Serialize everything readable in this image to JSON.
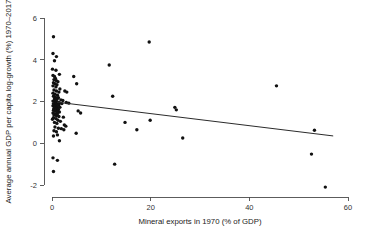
{
  "chart_data": {
    "type": "scatter",
    "title": "",
    "xlabel": "Mineral exports in 1970 (% of GDP)",
    "ylabel": "Average annual GDP per capita log-growth (%) 1970–2017",
    "xlim": [
      -2,
      62
    ],
    "ylim": [
      -2.7,
      6.4
    ],
    "xticks": [
      0,
      20,
      40,
      60
    ],
    "xtick_labels": [
      "0",
      "20",
      "40",
      "60"
    ],
    "yticks": [
      -2,
      0,
      2,
      4,
      6
    ],
    "ytick_labels": [
      "-2",
      "0",
      "2",
      "4",
      "6"
    ],
    "grid": false,
    "legend": "none",
    "marker": "filled-circle",
    "marker_color": "#111111",
    "fit_line": {
      "name": "linear fit",
      "color": "#2b2b2b",
      "x_start": 1.0,
      "y_start": 1.97,
      "x_end": 57.0,
      "y_end": 0.35
    },
    "points": [
      [
        0.3,
        5.1
      ],
      [
        0.2,
        4.3
      ],
      [
        0.9,
        4.15
      ],
      [
        0.5,
        3.95
      ],
      [
        0.1,
        3.55
      ],
      [
        0.8,
        3.5
      ],
      [
        1.5,
        3.3
      ],
      [
        0.2,
        3.25
      ],
      [
        0.5,
        3.2
      ],
      [
        0.7,
        3.1
      ],
      [
        0.4,
        3.05
      ],
      [
        0.9,
        3.0
      ],
      [
        1.2,
        2.95
      ],
      [
        0.3,
        2.9
      ],
      [
        0.6,
        2.85
      ],
      [
        1.0,
        2.8
      ],
      [
        0.2,
        2.75
      ],
      [
        0.8,
        2.7
      ],
      [
        4.4,
        3.2
      ],
      [
        5.0,
        2.85
      ],
      [
        1.6,
        2.6
      ],
      [
        0.4,
        2.55
      ],
      [
        0.9,
        2.5
      ],
      [
        1.4,
        2.45
      ],
      [
        0.2,
        2.4
      ],
      [
        0.6,
        2.35
      ],
      [
        1.1,
        2.3
      ],
      [
        2.6,
        2.5
      ],
      [
        3.0,
        2.45
      ],
      [
        0.3,
        2.25
      ],
      [
        0.7,
        2.2
      ],
      [
        1.3,
        2.18
      ],
      [
        0.5,
        2.12
      ],
      [
        1.0,
        2.1
      ],
      [
        1.8,
        2.08
      ],
      [
        2.2,
        2.05
      ],
      [
        0.2,
        2.02
      ],
      [
        0.6,
        2.0
      ],
      [
        0.9,
        1.98
      ],
      [
        1.2,
        1.96
      ],
      [
        1.5,
        1.94
      ],
      [
        0.3,
        1.9
      ],
      [
        0.7,
        1.88
      ],
      [
        1.0,
        1.86
      ],
      [
        1.4,
        1.84
      ],
      [
        2.0,
        1.9
      ],
      [
        2.9,
        1.95
      ],
      [
        3.4,
        1.92
      ],
      [
        0.2,
        1.8
      ],
      [
        0.5,
        1.78
      ],
      [
        0.8,
        1.76
      ],
      [
        1.1,
        1.74
      ],
      [
        1.6,
        1.72
      ],
      [
        0.4,
        1.68
      ],
      [
        0.9,
        1.65
      ],
      [
        1.3,
        1.62
      ],
      [
        0.3,
        1.58
      ],
      [
        0.7,
        1.55
      ],
      [
        1.0,
        1.52
      ],
      [
        1.5,
        1.5
      ],
      [
        5.3,
        1.55
      ],
      [
        5.8,
        1.45
      ],
      [
        0.2,
        1.45
      ],
      [
        0.6,
        1.42
      ],
      [
        1.1,
        1.4
      ],
      [
        0.4,
        1.35
      ],
      [
        0.9,
        1.32
      ],
      [
        1.4,
        1.28
      ],
      [
        2.3,
        1.25
      ],
      [
        0.3,
        1.22
      ],
      [
        0.8,
        1.18
      ],
      [
        0.1,
        1.15
      ],
      [
        1.2,
        1.1
      ],
      [
        1.7,
        1.05
      ],
      [
        0.5,
        1.0
      ],
      [
        1.0,
        0.95
      ],
      [
        2.5,
        0.88
      ],
      [
        2.8,
        0.82
      ],
      [
        0.6,
        0.78
      ],
      [
        1.3,
        0.72
      ],
      [
        1.9,
        0.7
      ],
      [
        2.4,
        0.65
      ],
      [
        0.4,
        0.6
      ],
      [
        0.9,
        0.55
      ],
      [
        4.9,
        0.48
      ],
      [
        1.1,
        0.4
      ],
      [
        0.3,
        0.35
      ],
      [
        1.5,
        0.12
      ],
      [
        0.2,
        -0.7
      ],
      [
        1.1,
        -0.82
      ],
      [
        0.3,
        -1.35
      ],
      [
        12.3,
        2.25
      ],
      [
        11.6,
        3.75
      ],
      [
        19.7,
        4.85
      ],
      [
        14.8,
        1.0
      ],
      [
        17.2,
        0.65
      ],
      [
        19.9,
        1.1
      ],
      [
        12.7,
        -1.0
      ],
      [
        24.9,
        1.72
      ],
      [
        25.2,
        1.6
      ],
      [
        26.5,
        0.25
      ],
      [
        45.5,
        2.75
      ],
      [
        53.2,
        0.62
      ],
      [
        52.6,
        -0.52
      ],
      [
        55.4,
        -2.1
      ]
    ]
  }
}
